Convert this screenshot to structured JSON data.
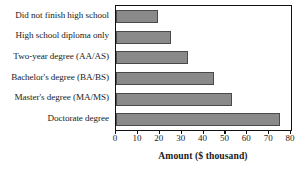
{
  "chart_data": {
    "type": "bar",
    "orientation": "horizontal",
    "title": "",
    "xlabel": "Amount ($ thousand)",
    "ylabel": "",
    "categories": [
      "Did not finish high school",
      "High school diploma only",
      "Two-year degree (AA/AS)",
      "Bachelor's degree (BA/BS)",
      "Master's degree (MA/MS)",
      "Doctorate degree"
    ],
    "values": [
      19,
      25,
      33,
      45,
      53,
      75
    ],
    "xlim": [
      0,
      80
    ],
    "xticks": [
      0,
      10,
      20,
      30,
      40,
      50,
      60,
      70,
      80
    ],
    "grid": false,
    "legend": false,
    "bar_color": "#8a8a8a",
    "bar_edge_color": "#4a4a4a",
    "axis_color": "#111111"
  }
}
